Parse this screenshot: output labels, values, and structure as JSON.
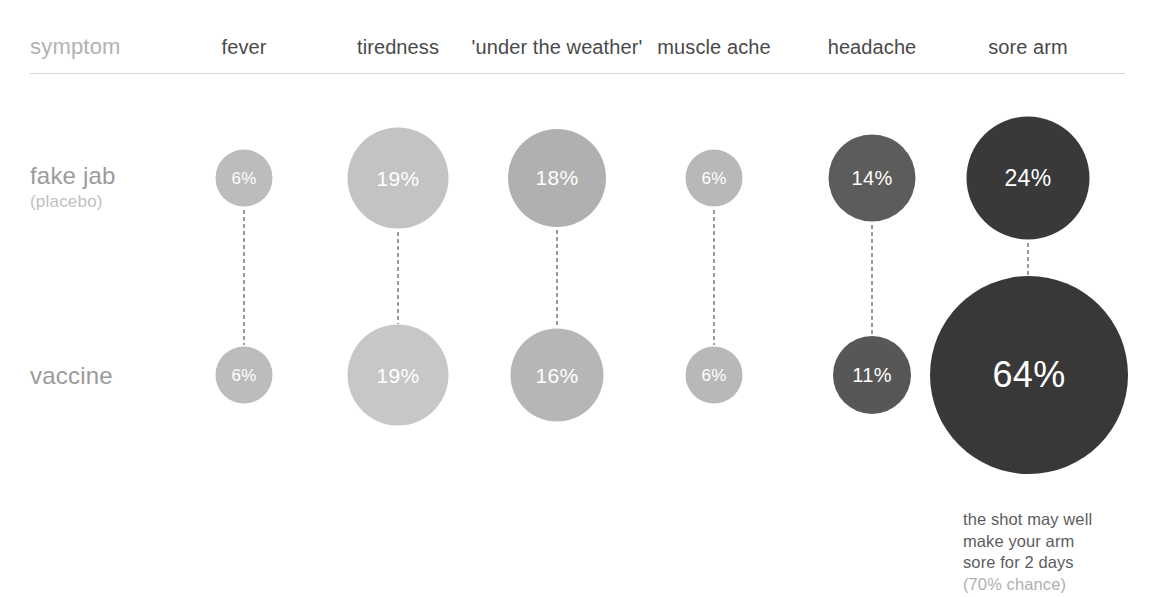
{
  "chart_data": {
    "type": "bubble",
    "title": "",
    "row_header_label": "symptom",
    "categories": [
      "fever",
      "tiredness",
      "'under the weather'",
      "muscle ache",
      "headache",
      "sore arm"
    ],
    "series": [
      {
        "name": "fake jab",
        "subtitle": "(placebo)",
        "values": [
          6,
          19,
          18,
          6,
          14,
          24
        ],
        "labels": [
          "6%",
          "19%",
          "18%",
          "6%",
          "14%",
          "24%"
        ]
      },
      {
        "name": "vaccine",
        "subtitle": "",
        "values": [
          6,
          19,
          16,
          6,
          11,
          64
        ],
        "labels": [
          "6%",
          "19%",
          "16%",
          "6%",
          "11%",
          "64%"
        ]
      }
    ],
    "unit": "%",
    "encoding": "circle area proportional to percentage; fill darkens as value increases",
    "annotation": {
      "text": "the shot may well\nmake your arm\nsore for 2 days",
      "chance": "(70% chance)",
      "attached_to": {
        "series": "vaccine",
        "category": "sore arm",
        "value": 64
      }
    },
    "colors": {
      "background": "#ffffff",
      "rule": "#d6d6d6",
      "connector": "#9a9a9a",
      "bubble_label": "#ffffff",
      "column_header": "#4a4a4a",
      "row_title": "#9b9b9b",
      "row_subtitle": "#c0c0c0",
      "symptom_label": "#b2b2b2",
      "annotation": "#5d5d5d",
      "annotation_muted": "#b0b0b0",
      "scale": [
        "#bdbdbd",
        "#b4b4b4",
        "#ababab",
        "#9c9c9c",
        "#5a5a5a",
        "#4e4e4e",
        "#3a3a3a"
      ]
    },
    "bubbles": [
      {
        "row": 0,
        "col": 0,
        "label": "6%",
        "value": 6,
        "cx": 244,
        "cy": 178,
        "d": 57,
        "fill": "#bcbcbc",
        "font": 17
      },
      {
        "row": 0,
        "col": 1,
        "label": "19%",
        "value": 19,
        "cx": 398,
        "cy": 178,
        "d": 101,
        "fill": "#c3c3c3",
        "font": 21
      },
      {
        "row": 0,
        "col": 2,
        "label": "18%",
        "value": 18,
        "cx": 557,
        "cy": 178,
        "d": 98,
        "fill": "#b0b0b0",
        "font": 21
      },
      {
        "row": 0,
        "col": 3,
        "label": "6%",
        "value": 6,
        "cx": 714,
        "cy": 178,
        "d": 57,
        "fill": "#b8b8b8",
        "font": 17
      },
      {
        "row": 0,
        "col": 4,
        "label": "14%",
        "value": 14,
        "cx": 872,
        "cy": 178,
        "d": 87,
        "fill": "#5c5c5c",
        "font": 20
      },
      {
        "row": 0,
        "col": 5,
        "label": "24%",
        "value": 24,
        "cx": 1028,
        "cy": 178,
        "d": 123,
        "fill": "#393939",
        "font": 23
      },
      {
        "row": 1,
        "col": 0,
        "label": "6%",
        "value": 6,
        "cx": 244,
        "cy": 375,
        "d": 57,
        "fill": "#bcbcbc",
        "font": 17
      },
      {
        "row": 1,
        "col": 1,
        "label": "19%",
        "value": 19,
        "cx": 398,
        "cy": 375,
        "d": 101,
        "fill": "#c7c7c7",
        "font": 21
      },
      {
        "row": 1,
        "col": 2,
        "label": "16%",
        "value": 16,
        "cx": 557,
        "cy": 375,
        "d": 93,
        "fill": "#b6b6b6",
        "font": 21
      },
      {
        "row": 1,
        "col": 3,
        "label": "6%",
        "value": 6,
        "cx": 714,
        "cy": 375,
        "d": 57,
        "fill": "#b8b8b8",
        "font": 17
      },
      {
        "row": 1,
        "col": 4,
        "label": "11%",
        "value": 11,
        "cx": 872,
        "cy": 375,
        "d": 78,
        "fill": "#575757",
        "font": 20
      },
      {
        "row": 1,
        "col": 5,
        "label": "64%",
        "value": 64,
        "cx": 1029,
        "cy": 375,
        "d": 198,
        "fill": "#383838",
        "font": 36
      }
    ],
    "connectors": [
      {
        "col": 0,
        "cx": 244,
        "top": 210,
        "height": 135
      },
      {
        "col": 1,
        "cx": 398,
        "top": 232,
        "height": 92
      },
      {
        "col": 2,
        "cx": 557,
        "top": 230,
        "height": 98
      },
      {
        "col": 3,
        "cx": 714,
        "top": 210,
        "height": 135
      },
      {
        "col": 4,
        "cx": 872,
        "top": 225,
        "height": 110
      },
      {
        "col": 5,
        "cx": 1028,
        "top": 243,
        "height": 32
      }
    ],
    "column_header_positions": [
      244,
      398,
      557,
      714,
      872,
      1028
    ],
    "row_title_positions": [
      162,
      362
    ]
  }
}
